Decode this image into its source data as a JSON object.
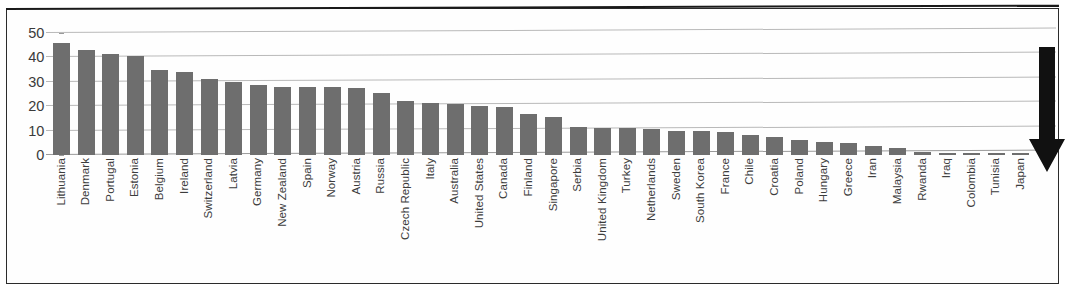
{
  "chart_data": {
    "type": "bar",
    "title": "",
    "subtitle": "",
    "xlabel": "",
    "ylabel": "",
    "ylim": [
      0,
      50
    ],
    "yticks": [
      0,
      10,
      20,
      30,
      40,
      50
    ],
    "grid": true,
    "legend": null,
    "bar_color": "#6e6e6e",
    "gridline_color": "#b9b9b9",
    "categories": [
      "Lithuania",
      "Denmark",
      "Portugal",
      "Estonia",
      "Belgium",
      "Ireland",
      "Switzerland",
      "Latvia",
      "Germany",
      "New Zealand",
      "Spain",
      "Norway",
      "Austria",
      "Russia",
      "Czech Republic",
      "Italy",
      "Australia",
      "United States",
      "Canada",
      "Finland",
      "Singapore",
      "Serbia",
      "United Kingdom",
      "Turkey",
      "Netherlands",
      "Sweden",
      "South Korea",
      "France",
      "Chile",
      "Croatia",
      "Poland",
      "Hungary",
      "Greece",
      "Iran",
      "Malaysia",
      "Rwanda",
      "Iraq",
      "Colombia",
      "Tunisia",
      "Japan"
    ],
    "values": [
      46,
      43,
      41.5,
      40.5,
      35,
      34,
      31,
      30,
      28.5,
      28,
      28,
      28,
      27.5,
      25.5,
      22,
      21.5,
      21,
      20,
      19.5,
      17,
      15.5,
      11.5,
      11,
      11,
      10.5,
      10,
      10,
      9.5,
      8,
      7.5,
      6,
      5.5,
      5,
      3.5,
      2.8,
      1.2,
      1,
      0.9,
      0.8,
      0.7
    ]
  },
  "annotations": {
    "arrow": {
      "name": "down-arrow-annotation",
      "direction": "down",
      "color": "#111111",
      "points_at": "Japan"
    }
  }
}
